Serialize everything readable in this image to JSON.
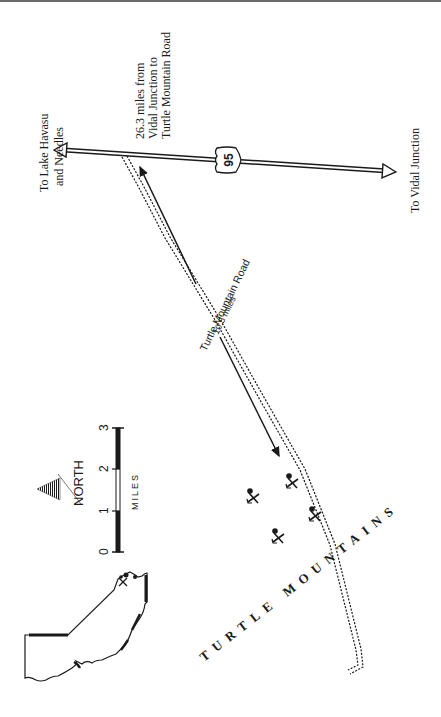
{
  "map": {
    "labels": {
      "north_destination_line1": "To Lake Havasu",
      "north_destination_line2": "and Needles",
      "south_destination": "To Vidal Junction",
      "distance_note_line1": "26.3 miles from",
      "distance_note_line2": "Vidal Junction to",
      "distance_note_line3": "Turtle Mountain Road",
      "highway_shield": "95",
      "side_road_name": "Turtle Mountain Road",
      "side_road_distance": "10.5 miles",
      "mountain_range": "TURTLE MOUNTAINS"
    },
    "legend": {
      "north_label": "NORTH",
      "scale_unit": "MILES",
      "scale_ticks": [
        "0",
        "1",
        "2",
        "3"
      ]
    },
    "features": {
      "mine_symbols_count": 4,
      "locator_map": "county outline with mine location marker"
    },
    "colors": {
      "ink": "#1a1a1a",
      "background": "#ffffff"
    }
  }
}
